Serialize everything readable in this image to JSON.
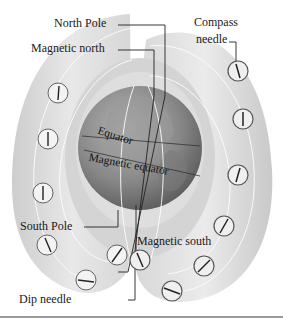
{
  "diagram": {
    "type": "earth-magnetic-field-illustration",
    "labels": {
      "north_pole": "North Pole",
      "magnetic_north": "Magnetic north",
      "compass_needle": "Compass\nneedle",
      "compass_line1": "Compass",
      "compass_line2": "needle",
      "equator": "Equator",
      "magnetic_equator": "Magnetic equator",
      "south_pole": "South Pole",
      "magnetic_south": "Magnetic south",
      "dip_needle": "Dip needle"
    },
    "colors": {
      "field_shell_light": "#e4e4e4",
      "field_shell_mid": "#cfcfcf",
      "globe_dark": "#6e6e6e",
      "globe_light": "#a8a8a8",
      "field_lines": "#ffffff",
      "leader_lines": "#222222",
      "text": "#1a1a1a"
    },
    "left_dip_needles": 6,
    "right_compasses": 7
  }
}
